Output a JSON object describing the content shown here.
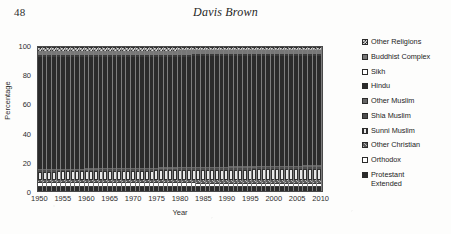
{
  "page": {
    "folio": "48",
    "running_head": "Davis Brown"
  },
  "chart_data": {
    "type": "bar",
    "subtype": "100% stacked bar",
    "title": "",
    "xlabel": "Year",
    "ylabel": "Percentage",
    "ylim": [
      0,
      100
    ],
    "ytick_labels": [
      "0",
      "20",
      "40",
      "60",
      "80",
      "100"
    ],
    "ytick_values": [
      0,
      20,
      40,
      60,
      80,
      100
    ],
    "xtick_labels": [
      "1950",
      "1955",
      "1960",
      "1965",
      "1970",
      "1975",
      "1980",
      "1985",
      "1990",
      "1995",
      "2000",
      "2005",
      "2010"
    ],
    "xtick_values": [
      1950,
      1955,
      1960,
      1965,
      1970,
      1975,
      1980,
      1985,
      1990,
      1995,
      2000,
      2005,
      2010
    ],
    "x_start": 1950,
    "x_end": 2010,
    "x_step": 1,
    "grid": false,
    "legend_position": "right",
    "legend_entries": [
      "Other Religions",
      "Buddhist Complex",
      "Sikh",
      "Hindu",
      "Other Muslim",
      "Shia Muslim",
      "Sunni Muslim",
      "Other Christian",
      "Orthodox",
      "Protestant\nExtended"
    ],
    "series": [
      {
        "name": "Protestant Extended",
        "pattern": "solid-dark",
        "values_start": 3.0,
        "values_end": 2.5
      },
      {
        "name": "Orthodox",
        "pattern": "open",
        "values_start": 3.5,
        "values_end": 3.0
      },
      {
        "name": "Other Christian",
        "pattern": "hatch",
        "values_start": 1.5,
        "values_end": 2.0
      },
      {
        "name": "Sunni Muslim",
        "pattern": "vline",
        "values_start": 5.5,
        "values_end": 8.0
      },
      {
        "name": "Shia Muslim",
        "pattern": "solid-mid",
        "values_start": 1.0,
        "values_end": 1.5
      },
      {
        "name": "Other Muslim",
        "pattern": "grid",
        "values_start": 0.8,
        "values_end": 1.0
      },
      {
        "name": "Hindu",
        "pattern": "solid-dark",
        "values_start": 78.0,
        "values_end": 76.5
      },
      {
        "name": "Sikh",
        "pattern": "open",
        "values_start": 0.8,
        "values_end": 0.8
      },
      {
        "name": "Buddhist Complex",
        "pattern": "dot",
        "values_start": 3.0,
        "values_end": 2.7
      },
      {
        "name": "Other Religions",
        "pattern": "check",
        "values_start": 2.9,
        "values_end": 2.0
      }
    ],
    "stack_bottom_to_top": [
      "Protestant Extended",
      "Orthodox",
      "Other Christian",
      "Sunni Muslim",
      "Shia Muslim",
      "Other Muslim",
      "Hindu",
      "Sikh",
      "Buddhist Complex",
      "Other Religions"
    ]
  }
}
